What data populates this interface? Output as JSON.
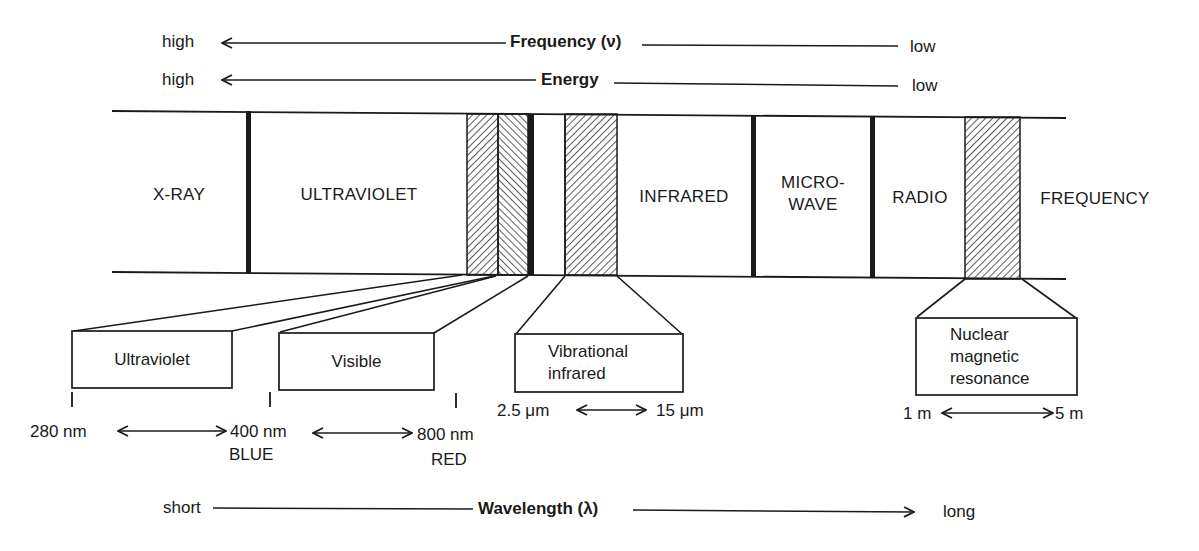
{
  "frequency_axis": {
    "left_label": "high",
    "title": "Frequency (ν)",
    "right_label": "low",
    "arrow_direction": "left"
  },
  "energy_axis": {
    "left_label": "high",
    "title": "Energy",
    "right_label": "low",
    "arrow_direction": "left"
  },
  "spectrum_band": {
    "regions": [
      {
        "label": "X-RAY"
      },
      {
        "label": "ULTRAVIOLET"
      },
      {
        "label": "INFRARED"
      },
      {
        "label_line1": "MICRO-",
        "label_line2": "WAVE"
      },
      {
        "label": "RADIO"
      },
      {
        "label": "FREQUENCY"
      }
    ],
    "hatched_strips": [
      "ultraviolet-window",
      "visible-window",
      "vibrational-infrared-window",
      "nmr-window"
    ]
  },
  "detail_boxes": {
    "ultraviolet": {
      "label": "Ultraviolet"
    },
    "visible": {
      "label": "Visible"
    },
    "vibrational": {
      "line1": "Vibrational",
      "line2": "infrared"
    },
    "nmr": {
      "line1": "Nuclear",
      "line2": "magnetic",
      "line3": "resonance"
    }
  },
  "ranges": {
    "uv_start": "280 nm",
    "uv_end": "400 nm",
    "uv_end_color": "BLUE",
    "vis_end": "800 nm",
    "vis_end_color": "RED",
    "ir_start": "2.5 μm",
    "ir_end": "15 μm",
    "nmr_start": "1 m",
    "nmr_end": "5 m"
  },
  "wavelength_axis": {
    "left_label": "short",
    "title": "Wavelength (λ)",
    "right_label": "long",
    "arrow_direction": "right"
  }
}
